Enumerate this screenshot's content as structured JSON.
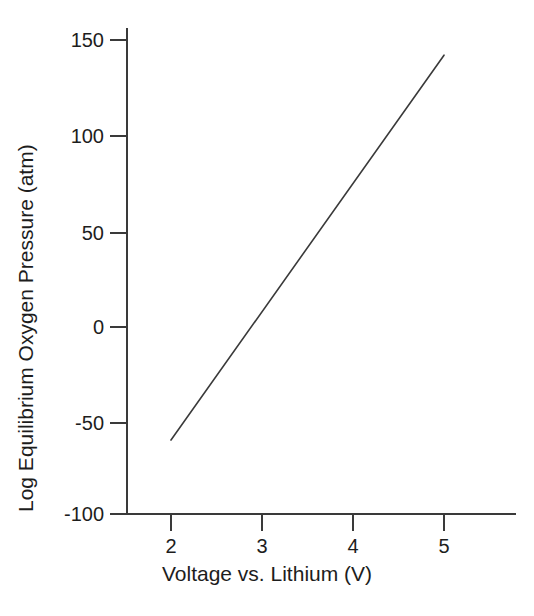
{
  "figure": {
    "background_color": "#ffffff",
    "ink_color": "#3a3a3a",
    "text_color": "#1d1d1d"
  },
  "chart_data": {
    "type": "line",
    "title": "",
    "xlabel": "Voltage vs. Lithium (V)",
    "ylabel": "Log Equilibrium Oxygen Pressure (atm)",
    "xlim": [
      1.6,
      5.8
    ],
    "ylim": [
      -100,
      155
    ],
    "xticks": [
      2,
      3,
      4,
      5
    ],
    "xtick_labels": [
      "2",
      "3",
      "4",
      "5"
    ],
    "yticks": [
      -100,
      -50,
      0,
      50,
      100,
      150
    ],
    "ytick_labels": [
      "-100",
      "-50",
      "0",
      "50",
      "100",
      "150"
    ],
    "grid": false,
    "legend": null,
    "series": [
      {
        "name": "Equilibrium oxygen pressure",
        "color": "#3a3a3a",
        "line_width": 1.6,
        "x": [
          2.0,
          5.0
        ],
        "y": [
          -61,
          142
        ]
      }
    ],
    "annotations": []
  }
}
